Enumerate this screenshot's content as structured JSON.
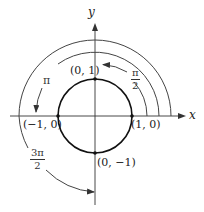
{
  "diagram": {
    "axes": {
      "x_label": "x",
      "y_label": "y"
    },
    "unit_circle": {
      "points": [
        {
          "id": "top",
          "label": "(0, 1)"
        },
        {
          "id": "right",
          "label": "(1, 0)"
        },
        {
          "id": "left",
          "label": "(−1, 0)"
        },
        {
          "id": "bottom",
          "label": "(0, −1)"
        }
      ]
    },
    "arcs": [
      {
        "id": "half-pi",
        "label_num": "π",
        "label_den": "2",
        "angle": "π/2"
      },
      {
        "id": "pi",
        "label": "π",
        "angle": "π"
      },
      {
        "id": "three-half-pi",
        "label_num": "3π",
        "label_den": "2",
        "angle": "3π/2"
      }
    ],
    "colors": {
      "ink": "#222222",
      "arc": "#444444"
    }
  }
}
